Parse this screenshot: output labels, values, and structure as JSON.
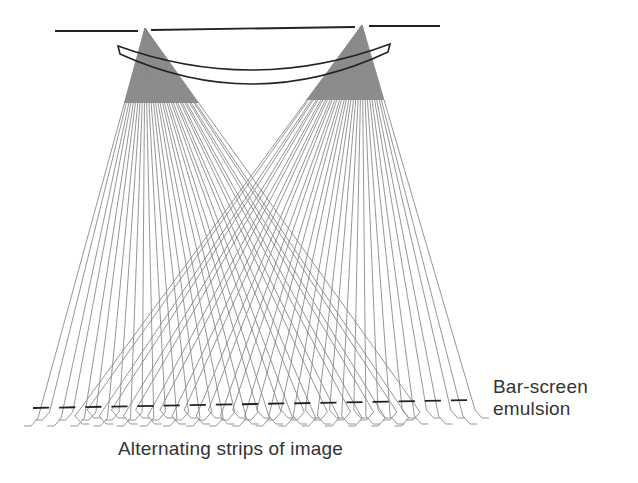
{
  "diagram": {
    "colors": {
      "background": "#ffffff",
      "ray": "#8a8a8a",
      "fan_fill": "#7a7a7a",
      "outline": "#222222",
      "text": "#333333"
    },
    "aperture_plane": {
      "segments": [
        {
          "x1": 55,
          "y1": 31,
          "x2": 138,
          "y2": 31
        },
        {
          "x1": 151,
          "y1": 30,
          "x2": 355,
          "y2": 27
        },
        {
          "x1": 369,
          "y1": 26,
          "x2": 440,
          "y2": 26
        }
      ]
    },
    "lens": {
      "left_x": 118,
      "right_x": 390,
      "top_left_y": 46,
      "top_right_y": 44,
      "sag_top": 70,
      "sag_bottom": 84,
      "thickness": 8
    },
    "fans": [
      {
        "name": "left-projection",
        "apex": [
          145,
          28
        ],
        "x_start": 38,
        "x_end": 420,
        "y_end": 412,
        "ray_count": 34
      },
      {
        "name": "right-projection",
        "apex": [
          362,
          25
        ],
        "x_start": 75,
        "x_end": 475,
        "y_end": 410,
        "ray_count": 34
      }
    ],
    "bar_screen": {
      "x1": 33,
      "y1": 408,
      "x2": 477,
      "y2": 400,
      "segment_count": 17
    },
    "labels": {
      "emulsion_line1": "Bar-screen",
      "emulsion_line2": "emulsion",
      "strips": "Alternating strips of image"
    }
  }
}
